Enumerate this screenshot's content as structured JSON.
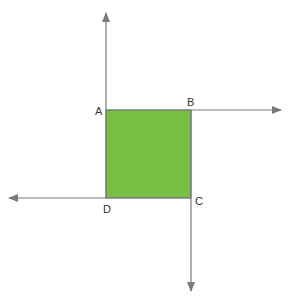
{
  "diagram": {
    "shape": "square",
    "fill_color": "#77c043",
    "line_color": "#7a7a7a",
    "vertices": [
      {
        "label": "A",
        "x": 106,
        "y": 110
      },
      {
        "label": "B",
        "x": 191,
        "y": 110
      },
      {
        "label": "C",
        "x": 191,
        "y": 198
      },
      {
        "label": "D",
        "x": 106,
        "y": 198
      }
    ],
    "rays": [
      {
        "from": "A",
        "direction": "up"
      },
      {
        "from": "B",
        "direction": "right"
      },
      {
        "from": "C",
        "direction": "down"
      },
      {
        "from": "D",
        "direction": "left"
      }
    ]
  }
}
